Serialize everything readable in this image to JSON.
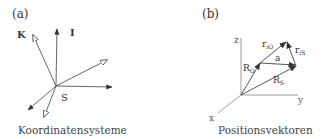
{
  "panels": [
    {
      "id": "a",
      "label": "(a)",
      "caption": "Koordinatensysteme",
      "labels": {
        "K": "K",
        "I": "I",
        "S": "S"
      }
    },
    {
      "id": "b",
      "label": "(b)",
      "caption": "Positionsvektoren",
      "axes": {
        "x": "x",
        "y": "y",
        "z": "z"
      },
      "vectors": {
        "R_O": {
          "main": "R",
          "sub": "O"
        },
        "R_S": {
          "main": "R",
          "sub": "S"
        },
        "r_iO": {
          "main": "r",
          "sub": "iO"
        },
        "r_iS": {
          "main": "r",
          "sub": "iS"
        },
        "a": {
          "main": "a"
        }
      }
    }
  ],
  "colors": {
    "line": "#555555",
    "arrow_fill": "#333333",
    "text": "#333333"
  }
}
